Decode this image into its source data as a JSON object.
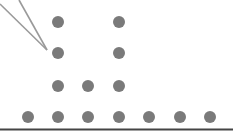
{
  "chart_data": {
    "type": "scatter",
    "subtype": "dot_plot",
    "title": "",
    "xlabel": "",
    "ylabel": "",
    "categories": [
      "1",
      "2",
      "3",
      "4",
      "5",
      "6",
      "7"
    ],
    "values": [
      1,
      4,
      2,
      4,
      1,
      1,
      1
    ],
    "annotation": {
      "type": "pointer",
      "target": {
        "column": 2,
        "stack_level": 3
      }
    },
    "colors": {
      "dot": "#7a7a7a",
      "baseline": "#444444",
      "pointer": "#9a9a9a"
    },
    "grid": false,
    "legend": null
  },
  "layout": {
    "column_x": [
      28,
      58,
      88,
      119,
      149,
      180,
      210
    ],
    "row_y": [
      117,
      86,
      53,
      22
    ],
    "dot_radius": 6,
    "baseline_y": 129.5
  }
}
